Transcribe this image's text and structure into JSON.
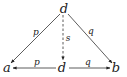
{
  "diagram": {
    "type": "commutative-diagram",
    "nodes": {
      "top": {
        "label": "d",
        "x": 64,
        "y": 8
      },
      "left": {
        "label": "a",
        "x": 7,
        "y": 68
      },
      "center": {
        "label": "d",
        "x": 62,
        "y": 68
      },
      "right": {
        "label": "b",
        "x": 116,
        "y": 68
      }
    },
    "edges": {
      "top_to_left": {
        "label": "p",
        "style": "solid",
        "lx": 36,
        "ly": 32
      },
      "top_to_right": {
        "label": "q",
        "style": "solid",
        "lx": 91,
        "ly": 31
      },
      "top_to_center": {
        "label": "s",
        "style": "dashed",
        "lx": 68,
        "ly": 38
      },
      "center_to_left": {
        "label": "p",
        "style": "solid",
        "lx": 37,
        "ly": 62
      },
      "center_to_right": {
        "label": "q",
        "style": "solid",
        "lx": 88,
        "ly": 62
      }
    },
    "colors": {
      "ink": "#222222",
      "background": "#ffffff"
    }
  }
}
